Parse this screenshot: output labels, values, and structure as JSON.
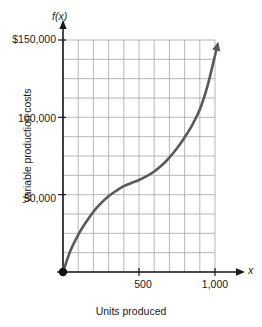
{
  "chart_data": {
    "type": "line",
    "title": "",
    "xlabel": "Units produced",
    "ylabel": "Variable production costs",
    "function_label": "f(x)",
    "x_axis_symbol": "x",
    "xlim": [
      0,
      1000
    ],
    "ylim": [
      0,
      150000
    ],
    "grid": true,
    "grid_columns": 10,
    "grid_rows": 12,
    "x_ticks": [
      {
        "value": 500,
        "label": "500"
      },
      {
        "value": 1000,
        "label": "1,000"
      }
    ],
    "y_ticks": [
      {
        "value": 50000,
        "label": "50,000"
      },
      {
        "value": 100000,
        "label": "100,000"
      },
      {
        "value": 150000,
        "label": "$150,000"
      }
    ],
    "origin_marker": "filled-dot",
    "arrowhead_at_end": true,
    "curve_color": "#595959",
    "grid_color": "#a6a6a6",
    "axis_color": "#1a1a1a",
    "series": [
      {
        "name": "Variable production costs",
        "points": [
          {
            "x": 0,
            "y": 0
          },
          {
            "x": 50,
            "y": 14000
          },
          {
            "x": 100,
            "y": 24000
          },
          {
            "x": 150,
            "y": 32000
          },
          {
            "x": 200,
            "y": 39000
          },
          {
            "x": 250,
            "y": 44500
          },
          {
            "x": 300,
            "y": 49000
          },
          {
            "x": 350,
            "y": 52500
          },
          {
            "x": 400,
            "y": 55500
          },
          {
            "x": 450,
            "y": 57500
          },
          {
            "x": 500,
            "y": 59500
          },
          {
            "x": 550,
            "y": 62000
          },
          {
            "x": 600,
            "y": 65000
          },
          {
            "x": 650,
            "y": 69000
          },
          {
            "x": 700,
            "y": 74000
          },
          {
            "x": 750,
            "y": 80000
          },
          {
            "x": 800,
            "y": 87000
          },
          {
            "x": 850,
            "y": 95000
          },
          {
            "x": 900,
            "y": 105000
          },
          {
            "x": 950,
            "y": 120000
          },
          {
            "x": 1000,
            "y": 140000
          }
        ]
      }
    ]
  },
  "labels": {
    "y_axis_title": "Variable production costs",
    "x_axis_title": "Units produced",
    "fx": "f(x)",
    "x_symbol": "x",
    "y150": "$150,000",
    "y100": "100,000",
    "y50": "50,000",
    "x500": "500",
    "x1000": "1,000"
  }
}
